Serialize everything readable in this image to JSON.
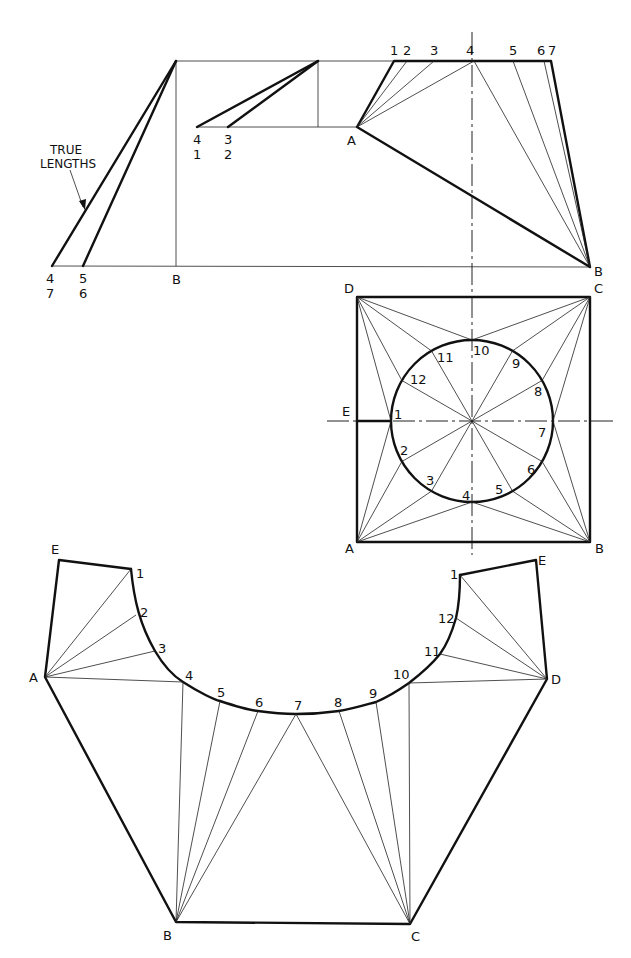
{
  "diagram": {
    "elevation": {
      "annotation_line1": "TRUE",
      "annotation_line2": "LENGTHS",
      "true_length_base_labels": [
        {
          "top": "4",
          "bottom": "7"
        },
        {
          "top": "5",
          "bottom": "6"
        }
      ],
      "base_label": "B",
      "short_true_length_labels": [
        {
          "top": "4",
          "bottom": "1"
        },
        {
          "top": "3",
          "bottom": "2"
        }
      ],
      "point_A": "A",
      "point_B": "B",
      "top_points": [
        "1",
        "2",
        "3",
        "4",
        "5",
        "6",
        "7"
      ]
    },
    "plan": {
      "corners": {
        "D": "D",
        "C": "C",
        "A": "A",
        "B": "B"
      },
      "seam_label": "E",
      "circle_points": [
        "1",
        "2",
        "3",
        "4",
        "5",
        "6",
        "7",
        "8",
        "9",
        "10",
        "11",
        "12"
      ]
    },
    "development": {
      "outer_points": {
        "E_left": "E",
        "A": "A",
        "B": "B",
        "C": "C",
        "D": "D",
        "E_right": "E"
      },
      "arc_points": [
        "1",
        "2",
        "3",
        "4",
        "5",
        "6",
        "7",
        "8",
        "9",
        "10",
        "11",
        "12",
        "1"
      ]
    }
  }
}
